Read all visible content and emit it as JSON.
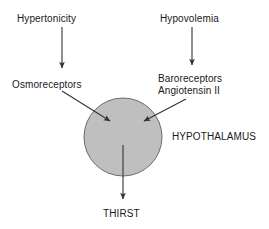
{
  "diagram": {
    "background_color": "#ffffff",
    "stroke_color": "#333333",
    "text_color": "#1a1a1a",
    "nodes": {
      "hypertonicity": {
        "label": "Hypertonicity",
        "type": "stimulus-label"
      },
      "hypovolemia": {
        "label": "Hypovolemia",
        "type": "stimulus-label"
      },
      "osmoreceptors": {
        "label": "Osmoreceptors",
        "type": "receptor-label"
      },
      "baroreceptors": {
        "label": "Baroreceptors\nAngiotensin II",
        "line1": "Baroreceptors",
        "line2": "Angiotensin II",
        "type": "receptor-label"
      },
      "hypothalamus": {
        "label": "HYPOTHALAMUS",
        "type": "organ-label",
        "shape": "circle",
        "fill_color": "#bfbfbf",
        "stroke_color": "#6b6b6b",
        "center_x": 123,
        "center_y": 137,
        "radius": 39
      },
      "thirst": {
        "label": "THIRST",
        "type": "outcome-label"
      }
    },
    "arrows": [
      {
        "name": "hypertonicity-to-osmoreceptors",
        "from": "hypertonicity",
        "to": "osmoreceptors",
        "orientation": "vertical-down"
      },
      {
        "name": "hypovolemia-to-baroreceptors",
        "from": "hypovolemia",
        "to": "baroreceptors",
        "orientation": "vertical-down"
      },
      {
        "name": "osmoreceptors-to-hypothalamus",
        "from": "osmoreceptors",
        "to": "hypothalamus",
        "orientation": "diagonal-down-right"
      },
      {
        "name": "baroreceptors-to-hypothalamus",
        "from": "baroreceptors",
        "to": "hypothalamus",
        "orientation": "diagonal-down-left"
      },
      {
        "name": "hypothalamus-to-thirst",
        "from": "hypothalamus",
        "to": "thirst",
        "orientation": "vertical-down"
      }
    ]
  }
}
